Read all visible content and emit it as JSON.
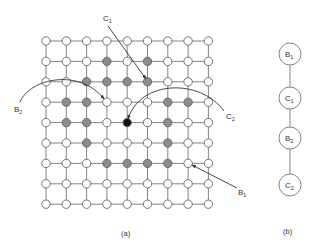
{
  "figure": {
    "panel_a": {
      "caption": "(a)",
      "grid": {
        "rows": 9,
        "cols": 9,
        "origin_x": 46,
        "origin_y": 41,
        "step_x": 20.3,
        "step_y": 20.4,
        "node_radius": 4.2,
        "colors": {
          "white": "#ffffff",
          "gray": "#8c8c8c",
          "black": "#111111",
          "edge": "#777777"
        },
        "gray_nodes": [
          [
            1,
            3
          ],
          [
            1,
            5
          ],
          [
            2,
            2
          ],
          [
            2,
            3
          ],
          [
            2,
            4
          ],
          [
            2,
            5
          ],
          [
            3,
            1
          ],
          [
            3,
            2
          ],
          [
            3,
            6
          ],
          [
            3,
            7
          ],
          [
            4,
            1
          ],
          [
            4,
            2
          ],
          [
            4,
            6
          ],
          [
            5,
            2
          ],
          [
            5,
            6
          ],
          [
            6,
            3
          ],
          [
            6,
            4
          ],
          [
            6,
            5
          ],
          [
            6,
            6
          ]
        ],
        "black_nodes": [
          [
            4,
            4
          ]
        ]
      },
      "annotations": [
        {
          "label": "C",
          "sub": "1",
          "label_x": 103,
          "label_y": 21
        },
        {
          "label": "B",
          "sub": "2",
          "label_x": 14,
          "label_y": 112
        },
        {
          "label": "C",
          "sub": "2",
          "label_x": 226,
          "label_y": 119
        },
        {
          "label": "B",
          "sub": "1",
          "label_x": 238,
          "label_y": 195
        }
      ]
    },
    "panel_b": {
      "caption": "(b)",
      "nodes": [
        {
          "label": "B",
          "sub": "1"
        },
        {
          "label": "C",
          "sub": "1"
        },
        {
          "label": "B",
          "sub": "2"
        },
        {
          "label": "C",
          "sub": "2"
        }
      ]
    }
  }
}
